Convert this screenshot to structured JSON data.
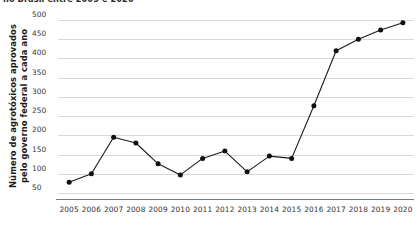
{
  "chart_data": {
    "type": "line",
    "title": "no Brasil entre 2005 e 2020",
    "xlabel": "",
    "ylabel": "Número de agrotóxicos aprovados pelo governo federal a cada ano",
    "ylabel_line1": "Número de agrotóxicos aprovados",
    "ylabel_line2": "pelo governo federal a cada ano",
    "categories": [
      "2005",
      "2006",
      "2007",
      "2008",
      "2009",
      "2010",
      "2011",
      "2012",
      "2013",
      "2014",
      "2015",
      "2016",
      "2017",
      "2018",
      "2019",
      "2020"
    ],
    "values": [
      78,
      100,
      195,
      180,
      126,
      97,
      140,
      159,
      105,
      146,
      140,
      277,
      420,
      450,
      474,
      493
    ],
    "x": [
      2005,
      2006,
      2007,
      2008,
      2009,
      2010,
      2011,
      2012,
      2013,
      2014,
      2015,
      2016,
      2017,
      2018,
      2019,
      2020
    ],
    "ylim": [
      50,
      500
    ],
    "yticks": [
      50,
      100,
      150,
      200,
      250,
      300,
      350,
      400,
      450,
      500
    ],
    "ytick_labels": [
      "50",
      "100",
      "150",
      "200",
      "250",
      "300",
      "350",
      "400",
      "450",
      "500"
    ],
    "grid": true,
    "legend": "none",
    "series_color": "#111111",
    "gridline_color": "#d8d8d8",
    "axis_color": "#7a7a7a",
    "background_color": "#ffffff",
    "marker": "circle"
  }
}
